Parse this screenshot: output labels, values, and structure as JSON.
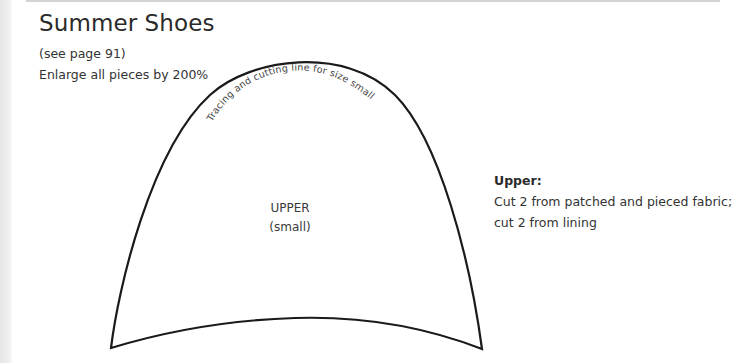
{
  "page": {
    "title": "Summer Shoes",
    "reference": "(see page 91)",
    "enlarge_note": "Enlarge all pieces by 200%"
  },
  "pattern_piece": {
    "curved_label": "Tracing and cutting line for size small",
    "name": "UPPER",
    "size": "(small)",
    "outline_color": "#1a1a1a"
  },
  "instructions": {
    "heading": "Upper:",
    "line1": "Cut 2 from patched and pieced fabric;",
    "line2": "cut 2 from lining"
  }
}
